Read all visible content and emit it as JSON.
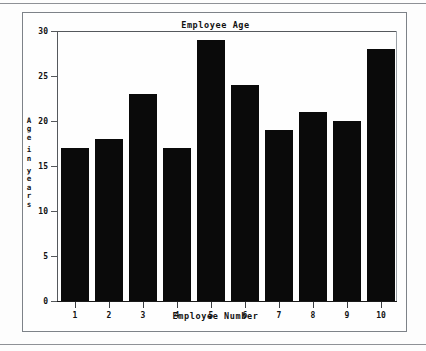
{
  "figure": {
    "title": "Employee Age",
    "xlabel": "Employee Number",
    "ylabel": "Age in years",
    "ylabel_chars": [
      "A",
      "g",
      "e",
      "",
      "i",
      "n",
      "",
      "y",
      "e",
      "a",
      "r",
      "s"
    ],
    "bar_color": "#0a0a0a",
    "frame_color": "#7d8288",
    "background": "#fefefe"
  },
  "chart_data": {
    "type": "bar",
    "title": "Employee Age",
    "xlabel": "Employee Number",
    "ylabel": "Age in years",
    "categories": [
      "1",
      "2",
      "3",
      "4",
      "5",
      "6",
      "7",
      "8",
      "9",
      "10"
    ],
    "values": [
      17,
      18,
      23,
      17,
      29,
      24,
      19,
      21,
      20,
      28
    ],
    "ylim": [
      0,
      30
    ],
    "yticks": [
      0,
      5,
      10,
      15,
      20,
      25,
      30
    ],
    "ytick_labels": [
      "0",
      "5",
      "10",
      "15",
      "20",
      "25",
      "30"
    ],
    "xtick_labels": [
      "1",
      "2",
      "3",
      "4",
      "5",
      "6",
      "7",
      "8",
      "9",
      "10"
    ],
    "grid": false,
    "legend": null,
    "series": [
      {
        "name": "Age in years",
        "values": [
          17,
          18,
          23,
          17,
          29,
          24,
          19,
          21,
          20,
          28
        ]
      }
    ]
  }
}
